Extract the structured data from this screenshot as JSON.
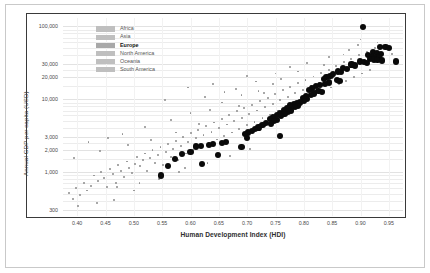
{
  "chart_data": {
    "type": "scatter",
    "title": "",
    "xlabel": "Human Development Index (HDI)",
    "ylabel": "Annual GDP per capita (USD)",
    "yscale": "log",
    "xlim": [
      0.375,
      0.975
    ],
    "ylim": [
      250,
      130000
    ],
    "grid": true,
    "legend_position": "top-left-inside",
    "xticks": [
      "0.40",
      "0.45",
      "0.50",
      "0.55",
      "0.60",
      "0.65",
      "0.70",
      "0.75",
      "0.80",
      "0.85",
      "0.90",
      "0.95"
    ],
    "xtick_values": [
      0.4,
      0.45,
      0.5,
      0.55,
      0.6,
      0.65,
      0.7,
      0.75,
      0.8,
      0.85,
      0.9,
      0.95
    ],
    "yticks": [
      "100,000",
      "30,000",
      "20,000",
      "10,000",
      "3,000",
      "2,000",
      "1,000",
      "300"
    ],
    "ytick_values": [
      100000,
      30000,
      20000,
      10000,
      3000,
      2000,
      1000,
      300
    ],
    "legend": [
      {
        "name": "Africa",
        "highlighted": false
      },
      {
        "name": "Asia",
        "highlighted": false
      },
      {
        "name": "Europe",
        "highlighted": true
      },
      {
        "name": "North America",
        "highlighted": false
      },
      {
        "name": "Oceania",
        "highlighted": false
      },
      {
        "name": "South America",
        "highlighted": false
      }
    ],
    "series": [
      {
        "name": "Europe",
        "highlighted": true,
        "marker": "large-black-circle",
        "color": "#0a0a0a",
        "points": [
          [
            0.905,
            98000
          ],
          [
            0.935,
            52000
          ],
          [
            0.944,
            52000
          ],
          [
            0.951,
            50000
          ],
          [
            0.922,
            44000
          ],
          [
            0.929,
            43000
          ],
          [
            0.936,
            42000
          ],
          [
            0.913,
            40000
          ],
          [
            0.921,
            39000
          ],
          [
            0.928,
            38000
          ],
          [
            0.933,
            37500
          ],
          [
            0.917,
            36000
          ],
          [
            0.924,
            35000
          ],
          [
            0.93,
            34500
          ],
          [
            0.938,
            34000
          ],
          [
            0.962,
            33000
          ],
          [
            0.899,
            33000
          ],
          [
            0.906,
            32000
          ],
          [
            0.911,
            31000
          ],
          [
            0.884,
            30000
          ],
          [
            0.89,
            29000
          ],
          [
            0.869,
            27000
          ],
          [
            0.876,
            26000
          ],
          [
            0.86,
            24000
          ],
          [
            0.866,
            23500
          ],
          [
            0.852,
            22000
          ],
          [
            0.847,
            21000
          ],
          [
            0.84,
            20000
          ],
          [
            0.835,
            19000
          ],
          [
            0.858,
            18500
          ],
          [
            0.863,
            18000
          ],
          [
            0.845,
            17000
          ],
          [
            0.838,
            16000
          ],
          [
            0.828,
            15500
          ],
          [
            0.822,
            15000
          ],
          [
            0.815,
            14000
          ],
          [
            0.809,
            13500
          ],
          [
            0.826,
            13000
          ],
          [
            0.832,
            12500
          ],
          [
            0.818,
            12000
          ],
          [
            0.812,
            11500
          ],
          [
            0.804,
            11000
          ],
          [
            0.798,
            10500
          ],
          [
            0.806,
            10000
          ],
          [
            0.8,
            9500
          ],
          [
            0.793,
            9000
          ],
          [
            0.788,
            8800
          ],
          [
            0.782,
            8500
          ],
          [
            0.776,
            8200
          ],
          [
            0.79,
            8000
          ],
          [
            0.784,
            7800
          ],
          [
            0.77,
            7500
          ],
          [
            0.765,
            7200
          ],
          [
            0.778,
            7000
          ],
          [
            0.772,
            6800
          ],
          [
            0.758,
            6400
          ],
          [
            0.752,
            6000
          ],
          [
            0.766,
            6200
          ],
          [
            0.76,
            5900
          ],
          [
            0.745,
            5600
          ],
          [
            0.74,
            5400
          ],
          [
            0.753,
            5200
          ],
          [
            0.748,
            5000
          ],
          [
            0.733,
            4700
          ],
          [
            0.727,
            4400
          ],
          [
            0.742,
            4600
          ],
          [
            0.72,
            4100
          ],
          [
            0.714,
            3900
          ],
          [
            0.708,
            3700
          ],
          [
            0.702,
            3500
          ],
          [
            0.696,
            3300
          ],
          [
            0.758,
            3100
          ],
          [
            0.7,
            2900
          ],
          [
            0.663,
            2600
          ],
          [
            0.656,
            2500
          ],
          [
            0.64,
            2400
          ],
          [
            0.633,
            2350
          ],
          [
            0.618,
            2300
          ],
          [
            0.61,
            2250
          ],
          [
            0.69,
            2200
          ],
          [
            0.6,
            1900
          ],
          [
            0.585,
            1750
          ],
          [
            0.648,
            1700
          ],
          [
            0.573,
            1500
          ],
          [
            0.62,
            1300
          ],
          [
            0.56,
            1200
          ],
          [
            0.548,
            900
          ]
        ]
      },
      {
        "name": "Other regions",
        "highlighted": false,
        "marker": "small-gray-circle",
        "color": "#8d8d8d",
        "points": [
          [
            0.385,
            520
          ],
          [
            0.392,
            430
          ],
          [
            0.398,
            600
          ],
          [
            0.405,
            480
          ],
          [
            0.412,
            700
          ],
          [
            0.418,
            560
          ],
          [
            0.424,
            640
          ],
          [
            0.43,
            900
          ],
          [
            0.436,
            760
          ],
          [
            0.442,
            1000
          ],
          [
            0.448,
            820
          ],
          [
            0.452,
            620
          ],
          [
            0.458,
            1100
          ],
          [
            0.463,
            950
          ],
          [
            0.468,
            700
          ],
          [
            0.472,
            1250
          ],
          [
            0.478,
            1050
          ],
          [
            0.483,
            860
          ],
          [
            0.488,
            1400
          ],
          [
            0.492,
            1150
          ],
          [
            0.497,
            980
          ],
          [
            0.502,
            1300
          ],
          [
            0.506,
            1600
          ],
          [
            0.511,
            1200
          ],
          [
            0.516,
            1450
          ],
          [
            0.52,
            1800
          ],
          [
            0.524,
            1050
          ],
          [
            0.529,
            1550
          ],
          [
            0.533,
            2000
          ],
          [
            0.538,
            1350
          ],
          [
            0.542,
            1700
          ],
          [
            0.547,
            2200
          ],
          [
            0.551,
            1250
          ],
          [
            0.556,
            1900
          ],
          [
            0.56,
            2400
          ],
          [
            0.565,
            1600
          ],
          [
            0.569,
            2100
          ],
          [
            0.574,
            2700
          ],
          [
            0.578,
            1450
          ],
          [
            0.583,
            2300
          ],
          [
            0.587,
            3000
          ],
          [
            0.592,
            1800
          ],
          [
            0.596,
            2600
          ],
          [
            0.601,
            3400
          ],
          [
            0.605,
            2000
          ],
          [
            0.61,
            2900
          ],
          [
            0.614,
            3800
          ],
          [
            0.619,
            2200
          ],
          [
            0.623,
            3200
          ],
          [
            0.628,
            4300
          ],
          [
            0.632,
            2500
          ],
          [
            0.637,
            3600
          ],
          [
            0.641,
            4800
          ],
          [
            0.646,
            2800
          ],
          [
            0.65,
            4000
          ],
          [
            0.655,
            5400
          ],
          [
            0.659,
            3100
          ],
          [
            0.664,
            4500
          ],
          [
            0.668,
            6000
          ],
          [
            0.673,
            3500
          ],
          [
            0.677,
            5000
          ],
          [
            0.682,
            6800
          ],
          [
            0.686,
            3900
          ],
          [
            0.691,
            5600
          ],
          [
            0.695,
            7500
          ],
          [
            0.7,
            4400
          ],
          [
            0.704,
            6200
          ],
          [
            0.709,
            8400
          ],
          [
            0.713,
            4900
          ],
          [
            0.718,
            7000
          ],
          [
            0.722,
            9500
          ],
          [
            0.727,
            5500
          ],
          [
            0.731,
            7800
          ],
          [
            0.736,
            10500
          ],
          [
            0.74,
            6100
          ],
          [
            0.745,
            8700
          ],
          [
            0.749,
            11800
          ],
          [
            0.754,
            6800
          ],
          [
            0.758,
            9700
          ],
          [
            0.763,
            13200
          ],
          [
            0.767,
            7600
          ],
          [
            0.772,
            10800
          ],
          [
            0.776,
            14800
          ],
          [
            0.781,
            8500
          ],
          [
            0.785,
            12000
          ],
          [
            0.79,
            16500
          ],
          [
            0.794,
            9400
          ],
          [
            0.799,
            13400
          ],
          [
            0.803,
            18500
          ],
          [
            0.808,
            10500
          ],
          [
            0.812,
            15000
          ],
          [
            0.817,
            20500
          ],
          [
            0.821,
            11700
          ],
          [
            0.826,
            16800
          ],
          [
            0.83,
            23000
          ],
          [
            0.835,
            13000
          ],
          [
            0.839,
            18800
          ],
          [
            0.844,
            25500
          ],
          [
            0.848,
            14500
          ],
          [
            0.853,
            21000
          ],
          [
            0.857,
            28500
          ],
          [
            0.862,
            16200
          ],
          [
            0.866,
            23500
          ],
          [
            0.871,
            32000
          ],
          [
            0.875,
            18000
          ],
          [
            0.88,
            26000
          ],
          [
            0.884,
            35500
          ],
          [
            0.889,
            20000
          ],
          [
            0.893,
            29000
          ],
          [
            0.898,
            40000
          ],
          [
            0.902,
            22500
          ],
          [
            0.907,
            32500
          ],
          [
            0.911,
            45000
          ],
          [
            0.916,
            25000
          ],
          [
            0.92,
            36000
          ],
          [
            0.925,
            50000
          ],
          [
            0.555,
            9800
          ],
          [
            0.625,
            10800
          ],
          [
            0.69,
            11500
          ],
          [
            0.7,
            21000
          ],
          [
            0.66,
            12500
          ],
          [
            0.73,
            12000
          ],
          [
            0.745,
            16000
          ],
          [
            0.48,
            3300
          ],
          [
            0.52,
            4200
          ],
          [
            0.565,
            5200
          ],
          [
            0.6,
            6400
          ],
          [
            0.635,
            7200
          ],
          [
            0.42,
            2600
          ],
          [
            0.455,
            2900
          ],
          [
            0.395,
            1550
          ],
          [
            0.44,
            1950
          ],
          [
            0.49,
            2350
          ],
          [
            0.53,
            2750
          ],
          [
            0.575,
            3500
          ],
          [
            0.615,
            4600
          ],
          [
            0.655,
            9000
          ],
          [
            0.68,
            14000
          ],
          [
            0.715,
            17500
          ],
          [
            0.76,
            19000
          ],
          [
            0.79,
            24000
          ],
          [
            0.835,
            29500
          ],
          [
            0.87,
            41000
          ],
          [
            0.895,
            56000
          ],
          [
            0.51,
            700
          ],
          [
            0.545,
            800
          ],
          [
            0.58,
            1000
          ],
          [
            0.47,
            620
          ],
          [
            0.435,
            380
          ],
          [
            0.402,
            340
          ],
          [
            0.465,
            420
          ],
          [
            0.5,
            560
          ],
          [
            0.59,
            1150
          ],
          [
            0.63,
            1350
          ],
          [
            0.67,
            1650
          ],
          [
            0.705,
            2050
          ],
          [
            0.595,
            14500
          ],
          [
            0.64,
            16000
          ],
          [
            0.685,
            8000
          ],
          [
            0.72,
            13000
          ],
          [
            0.75,
            22500
          ],
          [
            0.775,
            27500
          ],
          [
            0.805,
            31000
          ],
          [
            0.845,
            38000
          ],
          [
            0.88,
            47000
          ],
          [
            0.93,
            60000
          ],
          [
            0.9,
            66000
          ],
          [
            0.955,
            42000
          ]
        ]
      }
    ]
  }
}
